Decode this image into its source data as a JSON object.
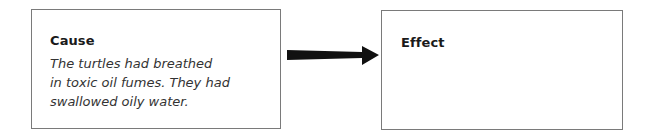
{
  "cause": {
    "heading": "Cause",
    "text": "The turtles had breathed in toxic oil fumes. They had swallowed oily water.",
    "lines": [
      "The turtles had breathed",
      "in toxic oil fumes. They had",
      "swallowed oily water."
    ]
  },
  "arrow": {
    "icon": "right-arrow-icon",
    "color": "#111111"
  },
  "effect": {
    "heading": "Effect",
    "text": ""
  }
}
